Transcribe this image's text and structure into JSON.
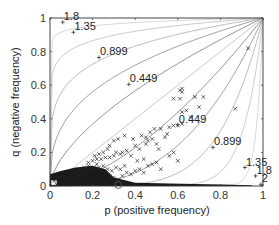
{
  "chart_data": {
    "type": "scatter",
    "title": "",
    "xlabel": "p (positive frequency)",
    "ylabel": "q (negative frequency)",
    "xlim": [
      0,
      1
    ],
    "ylim": [
      0,
      1
    ],
    "xticks": [
      0,
      0.2,
      0.4,
      0.6,
      0.8,
      1
    ],
    "yticks": [
      0,
      0.2,
      0.4,
      0.6,
      0.8,
      1
    ],
    "xtick_labels": [
      "0",
      "0.2",
      "0.4",
      "0.6",
      "0.8",
      "1"
    ],
    "ytick_labels": [
      "0",
      "0.2",
      "0.4",
      "0.6",
      "0.8",
      "1"
    ],
    "grid": false,
    "legend": null,
    "contour_levels": [
      0.449,
      0.899,
      1.35,
      1.8,
      2
    ],
    "contour_labels_upper": [
      {
        "text": "1.8",
        "p": 0.06,
        "q": 0.975
      },
      {
        "text": "1.35",
        "p": 0.11,
        "q": 0.915
      },
      {
        "text": "0.899",
        "p": 0.23,
        "q": 0.765
      },
      {
        "text": "0.449",
        "p": 0.37,
        "q": 0.605
      }
    ],
    "contour_labels_lower": [
      {
        "text": "0.449",
        "p": 0.6,
        "q": 0.365
      },
      {
        "text": "0.899",
        "p": 0.765,
        "q": 0.23
      },
      {
        "text": "1.35",
        "p": 0.915,
        "q": 0.11
      },
      {
        "text": "1.8",
        "p": 0.965,
        "q": 0.06
      },
      {
        "text": "2",
        "p": 0.99,
        "q": 0.01
      }
    ],
    "diagonal": {
      "from": [
        0,
        0
      ],
      "to": [
        1,
        1
      ]
    },
    "highlight_circle": {
      "p": 0.32,
      "q": 0.0
    },
    "series": [
      {
        "name": "samples",
        "marker": "x",
        "points": [
          [
            0.93,
            0.82
          ],
          [
            0.62,
            0.58
          ],
          [
            0.62,
            0.56
          ],
          [
            0.61,
            0.57
          ],
          [
            0.58,
            0.52
          ],
          [
            0.61,
            0.52
          ],
          [
            0.68,
            0.53
          ],
          [
            0.72,
            0.53
          ],
          [
            0.87,
            0.46
          ],
          [
            0.62,
            0.44
          ],
          [
            0.64,
            0.45
          ],
          [
            0.6,
            0.36
          ],
          [
            0.62,
            0.37
          ],
          [
            0.58,
            0.36
          ],
          [
            0.56,
            0.35
          ],
          [
            0.52,
            0.34
          ],
          [
            0.49,
            0.34
          ],
          [
            0.47,
            0.32
          ],
          [
            0.54,
            0.29
          ],
          [
            0.5,
            0.25
          ],
          [
            0.45,
            0.25
          ],
          [
            0.55,
            0.31
          ],
          [
            0.51,
            0.22
          ],
          [
            0.48,
            0.28
          ],
          [
            0.46,
            0.27
          ],
          [
            0.42,
            0.22
          ],
          [
            0.4,
            0.24
          ],
          [
            0.38,
            0.18
          ],
          [
            0.41,
            0.15
          ],
          [
            0.44,
            0.16
          ],
          [
            0.36,
            0.21
          ],
          [
            0.34,
            0.2
          ],
          [
            0.33,
            0.19
          ],
          [
            0.31,
            0.2
          ],
          [
            0.3,
            0.18
          ],
          [
            0.28,
            0.17
          ],
          [
            0.26,
            0.17
          ],
          [
            0.24,
            0.16
          ],
          [
            0.22,
            0.16
          ],
          [
            0.2,
            0.15
          ],
          [
            0.18,
            0.14
          ],
          [
            0.35,
            0.12
          ],
          [
            0.33,
            0.1
          ],
          [
            0.31,
            0.11
          ],
          [
            0.29,
            0.09
          ],
          [
            0.27,
            0.1
          ],
          [
            0.25,
            0.12
          ],
          [
            0.23,
            0.11
          ],
          [
            0.21,
            0.1
          ],
          [
            0.19,
            0.09
          ],
          [
            0.17,
            0.08
          ],
          [
            0.15,
            0.07
          ],
          [
            0.13,
            0.06
          ],
          [
            0.11,
            0.05
          ],
          [
            0.09,
            0.04
          ],
          [
            0.07,
            0.03
          ],
          [
            0.05,
            0.02
          ],
          [
            0.03,
            0.01
          ],
          [
            0.02,
            0.03
          ],
          [
            0.04,
            0.05
          ],
          [
            0.06,
            0.06
          ],
          [
            0.08,
            0.05
          ],
          [
            0.1,
            0.07
          ],
          [
            0.12,
            0.08
          ],
          [
            0.14,
            0.1
          ],
          [
            0.16,
            0.11
          ],
          [
            0.18,
            0.12
          ],
          [
            0.2,
            0.11
          ],
          [
            0.22,
            0.13
          ],
          [
            0.24,
            0.09
          ],
          [
            0.26,
            0.07
          ],
          [
            0.28,
            0.06
          ],
          [
            0.3,
            0.05
          ],
          [
            0.32,
            0.04
          ],
          [
            0.34,
            0.06
          ],
          [
            0.36,
            0.08
          ],
          [
            0.38,
            0.07
          ],
          [
            0.4,
            0.09
          ],
          [
            0.42,
            0.1
          ],
          [
            0.44,
            0.08
          ],
          [
            0.46,
            0.12
          ],
          [
            0.48,
            0.13
          ],
          [
            0.5,
            0.14
          ],
          [
            0.52,
            0.1
          ],
          [
            0.56,
            0.18
          ],
          [
            0.58,
            0.2
          ],
          [
            0.6,
            0.15
          ],
          [
            0.35,
            0.3
          ],
          [
            0.32,
            0.28
          ],
          [
            0.3,
            0.27
          ],
          [
            0.28,
            0.24
          ],
          [
            0.27,
            0.22
          ],
          [
            0.25,
            0.2
          ],
          [
            0.23,
            0.19
          ],
          [
            0.21,
            0.18
          ],
          [
            0.39,
            0.28
          ],
          [
            0.43,
            0.3
          ],
          [
            0.45,
            0.29
          ],
          [
            0.66,
            0.41
          ],
          [
            0.7,
            0.47
          ],
          [
            0.16,
            0.04
          ],
          [
            0.14,
            0.03
          ],
          [
            0.12,
            0.02
          ],
          [
            0.1,
            0.03
          ],
          [
            0.08,
            0.02
          ],
          [
            0.06,
            0.01
          ],
          [
            0.2,
            0.05
          ],
          [
            0.22,
            0.04
          ],
          [
            0.24,
            0.03
          ],
          [
            0.26,
            0.02
          ]
        ]
      }
    ],
    "dense_cluster": {
      "p_range": [
        0.0,
        0.3
      ],
      "q_range": [
        0.0,
        0.12
      ],
      "note": "heavily overlapping x markers forming a solid dark region"
    }
  }
}
